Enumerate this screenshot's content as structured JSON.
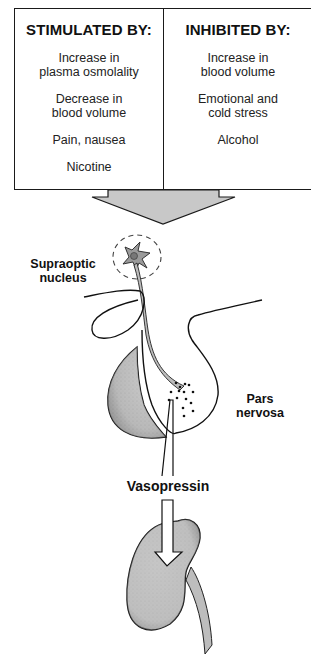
{
  "table": {
    "stimulated": {
      "heading": "STIMULATED BY:",
      "items": [
        "Increase in\nplasma osmolality",
        "Decrease in\nblood volume",
        "Pain, nausea",
        "Nicotine"
      ]
    },
    "inhibited": {
      "heading": "INHIBITED BY:",
      "items": [
        "Increase in\nblood volume",
        "Emotional and\ncold stress",
        "Alcohol"
      ]
    }
  },
  "labels": {
    "supraoptic": "Supraoptic\nnucleus",
    "pars_nervosa": "Pars\nnervosa",
    "vasopressin": "Vasopressin"
  },
  "icons": {
    "big_arrow": "down-arrow-icon",
    "neuron": "neuron-icon",
    "pituitary": "pituitary-gland-icon",
    "kidney": "kidney-icon"
  },
  "colors": {
    "line": "#1a1a1a",
    "fill_gray": "#c4c4c4",
    "arrow_gray": "#c8c8c8"
  }
}
